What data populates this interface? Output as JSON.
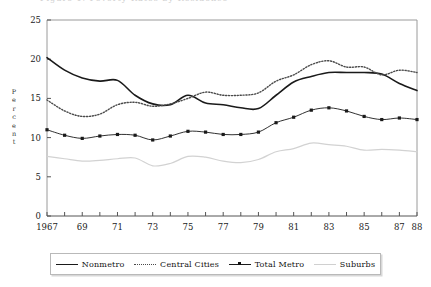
{
  "clipped_header": "Figure 1. Poverty Rates by Residence",
  "axes": {
    "ylabel_chars": [
      "P",
      "e",
      "r",
      "c",
      "e",
      "n",
      "t"
    ],
    "ylabel": "Percent",
    "yticks": [
      0,
      5,
      10,
      15,
      20,
      25
    ],
    "xtick_labels": [
      "1967",
      "69",
      "71",
      "73",
      "75",
      "77",
      "79",
      "81",
      "83",
      "85",
      "87",
      "88"
    ]
  },
  "legend": {
    "items": [
      {
        "label": "Nonmetro",
        "style": "solid",
        "icon": "solid-line-swatch"
      },
      {
        "label": "Central Cities",
        "style": "dotted",
        "icon": "dotted-line-swatch"
      },
      {
        "label": "Total Metro",
        "style": "marker",
        "icon": "marker-line-swatch"
      },
      {
        "label": "Suburbs",
        "style": "light",
        "icon": "light-line-swatch"
      }
    ]
  },
  "chart_data": {
    "type": "line",
    "title": "",
    "xlabel": "",
    "ylabel": "Percent",
    "xlim": [
      1967,
      1988
    ],
    "ylim": [
      0,
      25
    ],
    "grid": false,
    "legend_position": "bottom",
    "x": [
      1967,
      1968,
      1969,
      1970,
      1971,
      1972,
      1973,
      1974,
      1975,
      1976,
      1977,
      1978,
      1979,
      1980,
      1981,
      1982,
      1983,
      1984,
      1985,
      1986,
      1987,
      1988
    ],
    "tick_years": [
      1967,
      1969,
      1971,
      1973,
      1975,
      1977,
      1979,
      1981,
      1983,
      1985,
      1987,
      1988
    ],
    "series": [
      {
        "name": "Nonmetro",
        "color": "#1a1a1a",
        "style": "solid",
        "values": [
          20.2,
          18.6,
          17.6,
          17.2,
          17.3,
          15.4,
          14.3,
          14.2,
          15.4,
          14.4,
          14.2,
          13.8,
          13.7,
          15.4,
          17.1,
          17.8,
          18.3,
          18.3,
          18.3,
          18.1,
          16.9,
          16.0
        ]
      },
      {
        "name": "Central Cities",
        "color": "#4a4a4a",
        "style": "dotted",
        "values": [
          14.8,
          13.4,
          12.7,
          13.0,
          14.2,
          14.5,
          14.0,
          14.3,
          15.0,
          15.8,
          15.4,
          15.4,
          15.7,
          17.2,
          18.0,
          19.3,
          19.8,
          19.0,
          19.0,
          18.0,
          18.6,
          18.3
        ]
      },
      {
        "name": "Total Metro",
        "color": "#1a1a1a",
        "style": "marker",
        "values": [
          11.0,
          10.3,
          9.9,
          10.2,
          10.4,
          10.3,
          9.7,
          10.2,
          10.8,
          10.7,
          10.4,
          10.4,
          10.7,
          11.9,
          12.6,
          13.5,
          13.8,
          13.4,
          12.7,
          12.3,
          12.5,
          12.3
        ]
      },
      {
        "name": "Suburbs",
        "color": "#d2d2d2",
        "style": "light",
        "values": [
          7.6,
          7.3,
          7.0,
          7.1,
          7.3,
          7.4,
          6.4,
          6.7,
          7.6,
          7.5,
          7.0,
          6.8,
          7.2,
          8.2,
          8.6,
          9.3,
          9.1,
          8.9,
          8.4,
          8.5,
          8.4,
          8.2
        ]
      }
    ]
  }
}
